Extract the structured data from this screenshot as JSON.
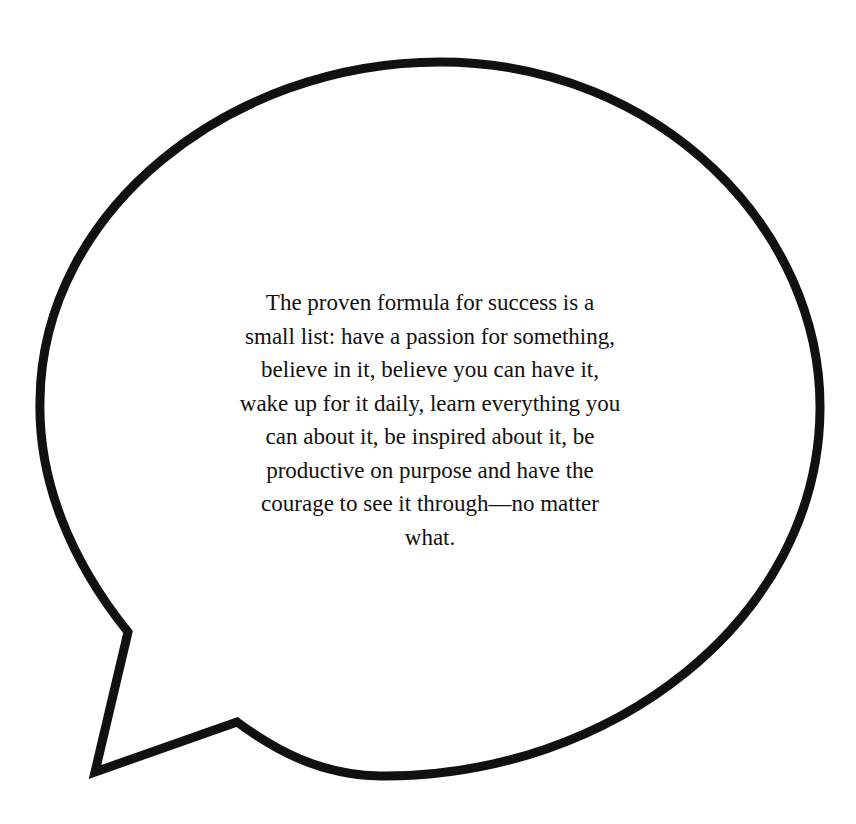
{
  "speech_bubble": {
    "stroke_color": "#111111",
    "fill_color": "#ffffff",
    "quote_lines": [
      "The proven formula for success is a",
      "small list: have a passion for something,",
      "believe in it, believe you can have it,",
      "wake up for it daily, learn everything you",
      "can about it, be inspired about it, be",
      "productive on purpose and have the",
      "courage to see it through—no matter",
      "what."
    ]
  }
}
